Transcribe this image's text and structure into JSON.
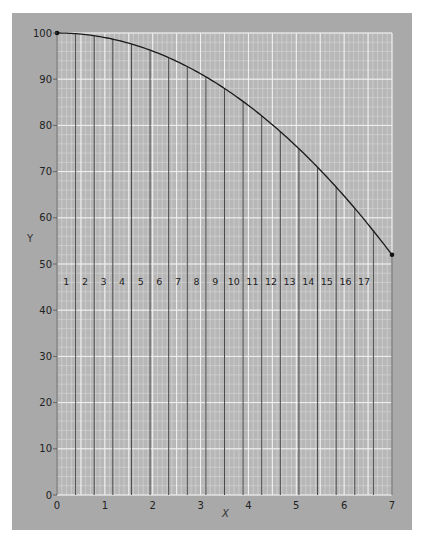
{
  "chart_data": {
    "type": "line",
    "title": "",
    "xlabel": "X",
    "ylabel": "Y",
    "xlim": [
      0,
      7
    ],
    "ylim": [
      0,
      100
    ],
    "x_ticks": [
      "0",
      "1",
      "2",
      "3",
      "4",
      "5",
      "6",
      "7"
    ],
    "y_ticks": [
      "0",
      "10",
      "20",
      "30",
      "40",
      "50",
      "60",
      "70",
      "80",
      "90",
      "100"
    ],
    "grid": true,
    "series": [
      {
        "name": "curve",
        "function": "y = 100 - 0.98 x^2",
        "x": [
          0,
          0.5,
          1,
          1.5,
          2,
          2.5,
          3,
          3.5,
          4,
          4.5,
          5,
          5.5,
          6,
          6.5,
          7
        ],
        "y": [
          100,
          99.8,
          99.0,
          97.8,
          96.1,
          93.9,
          91.2,
          88.0,
          84.3,
          80.2,
          75.5,
          70.4,
          64.7,
          58.6,
          52.0
        ]
      }
    ],
    "endpoints": [
      {
        "x": 0,
        "y": 100
      },
      {
        "x": 7,
        "y": 52
      }
    ],
    "strips": {
      "count": 18,
      "labels": [
        "1",
        "2",
        "3",
        "4",
        "5",
        "6",
        "7",
        "8",
        "9",
        "10",
        "11",
        "12",
        "13",
        "14",
        "15",
        "16",
        "17"
      ],
      "label_y": 46
    }
  },
  "axes": {
    "x_title": "X",
    "y_title": "Y"
  }
}
